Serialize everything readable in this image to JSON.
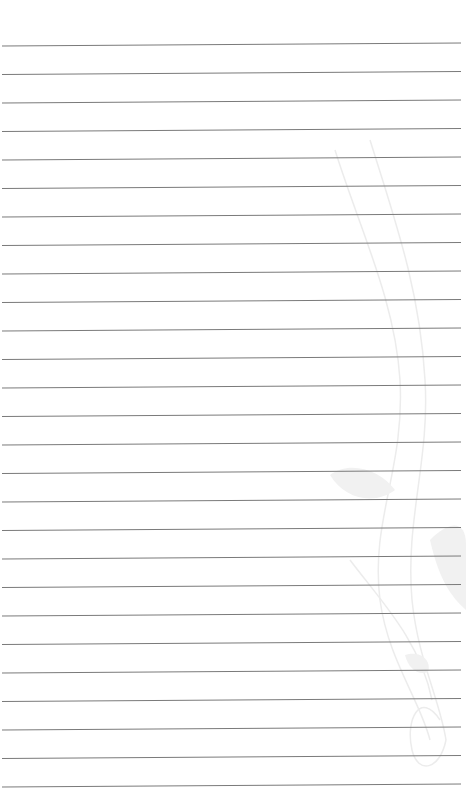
{
  "page": {
    "type": "lined-paper",
    "background_color": "#ffffff",
    "line_color": "#7a7a7a",
    "line_count": 27,
    "first_line_y": 46,
    "line_spacing": 28.5,
    "line_left_x": 2,
    "line_right_x": 461,
    "line_rise_px": 3
  },
  "watermark": {
    "icon": "violin-treble-clef-icon",
    "color": "#ececec"
  }
}
